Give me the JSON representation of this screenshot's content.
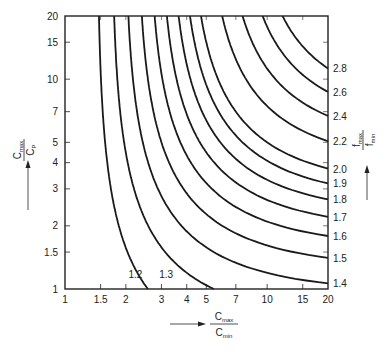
{
  "chart_data": {
    "type": "line",
    "title": "",
    "scale": "log-log",
    "xlabel": {
      "numerator": "C",
      "numerator_sub": "max",
      "denominator": "C",
      "denominator_sub": "min",
      "arrow": "right"
    },
    "ylabel": {
      "numerator": "C",
      "numerator_sub": "max",
      "denominator": "C",
      "denominator_sub": "P",
      "arrow": "up"
    },
    "right_label": {
      "numerator": "f",
      "numerator_sub": "max",
      "denominator": "f",
      "denominator_sub": "min",
      "arrow": "up"
    },
    "xlim": [
      1,
      20
    ],
    "ylim": [
      1,
      20
    ],
    "x_ticks": [
      1,
      1.5,
      2,
      3,
      4,
      5,
      7,
      10,
      15,
      20
    ],
    "x_tick_labels": [
      "1",
      "1.5",
      "2",
      "3",
      "4",
      "5",
      "7",
      "10",
      "15",
      "20"
    ],
    "y_ticks": [
      1,
      1.5,
      2,
      3,
      4,
      5,
      7,
      10,
      15,
      20
    ],
    "y_tick_labels": [
      "1",
      "1.5",
      "2",
      "3",
      "4",
      "5",
      "7",
      "10",
      "15",
      "20"
    ],
    "grid": false,
    "relation": "(fmax/fmin)^2 = X(Y+1)/(X+Y), X = Cmax/Cmin, Y = Cmax/Cp",
    "series": [
      {
        "name": "1.2",
        "fratio": 1.2,
        "label_pos": "inside-bottom",
        "points": [
          [
            1.47,
            20
          ],
          [
            1.6,
            10
          ],
          [
            1.85,
            5
          ],
          [
            2.1,
            3
          ],
          [
            2.57,
            1
          ]
        ]
      },
      {
        "name": "1.3",
        "fratio": 1.3,
        "label_pos": "inside-bottom",
        "points": [
          [
            1.77,
            20
          ],
          [
            2.0,
            10
          ],
          [
            2.5,
            5
          ],
          [
            3.1,
            3
          ],
          [
            5.45,
            1
          ]
        ]
      },
      {
        "name": "1.4",
        "fratio": 1.4,
        "label_pos": "right",
        "points": [
          [
            2.1,
            20
          ],
          [
            2.5,
            10
          ],
          [
            3.3,
            5
          ],
          [
            4.6,
            3
          ],
          [
            20,
            1.04
          ]
        ]
      },
      {
        "name": "1.5",
        "fratio": 1.5,
        "label_pos": "right",
        "points": [
          [
            2.5,
            20
          ],
          [
            3.0,
            10
          ],
          [
            4.3,
            5
          ],
          [
            7.0,
            3
          ],
          [
            20,
            1.3
          ]
        ]
      },
      {
        "name": "1.6",
        "fratio": 1.6,
        "label_pos": "right",
        "points": [
          [
            2.9,
            20
          ],
          [
            3.6,
            10
          ],
          [
            5.7,
            5
          ],
          [
            20,
            1.6
          ]
        ]
      },
      {
        "name": "1.7",
        "fratio": 1.7,
        "label_pos": "right",
        "points": [
          [
            3.3,
            20
          ],
          [
            4.3,
            10
          ],
          [
            7.6,
            5
          ],
          [
            20,
            1.9
          ]
        ]
      },
      {
        "name": "1.8",
        "fratio": 1.8,
        "label_pos": "right",
        "points": [
          [
            3.8,
            20
          ],
          [
            5.1,
            10
          ],
          [
            10.8,
            5
          ],
          [
            20,
            2.3
          ]
        ]
      },
      {
        "name": "1.9",
        "fratio": 1.9,
        "label_pos": "right",
        "points": [
          [
            4.3,
            20
          ],
          [
            6.0,
            10
          ],
          [
            20,
            2.7
          ]
        ]
      },
      {
        "name": "2.0",
        "fratio": 2.0,
        "label_pos": "right",
        "points": [
          [
            4.9,
            20
          ],
          [
            7.1,
            10
          ],
          [
            20,
            3.2
          ]
        ]
      },
      {
        "name": "2.2",
        "fratio": 2.2,
        "label_pos": "right",
        "points": [
          [
            6.2,
            20
          ],
          [
            10.1,
            10
          ],
          [
            20,
            4.5
          ]
        ]
      },
      {
        "name": "2.4",
        "fratio": 2.4,
        "label_pos": "right",
        "points": [
          [
            7.8,
            20
          ],
          [
            15.1,
            10
          ],
          [
            20,
            6.4
          ]
        ]
      },
      {
        "name": "2.6",
        "fratio": 2.6,
        "label_pos": "right",
        "points": [
          [
            9.7,
            20
          ],
          [
            20,
            9.3
          ]
        ]
      },
      {
        "name": "2.8",
        "fratio": 2.8,
        "label_pos": "right",
        "points": [
          [
            12.2,
            20
          ],
          [
            20,
            13.6
          ]
        ]
      }
    ]
  }
}
